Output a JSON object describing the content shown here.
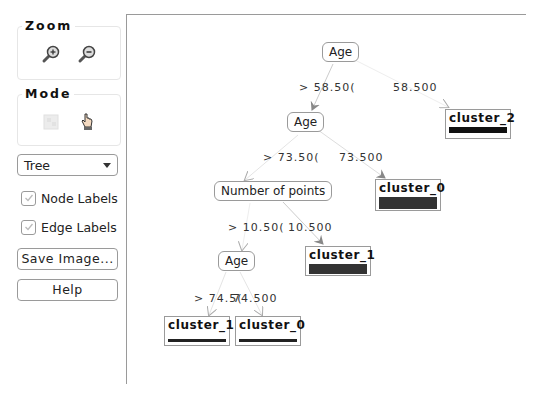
{
  "sidebar": {
    "zoom": {
      "title": "Zoom",
      "icons": [
        "zoom-in-icon",
        "zoom-out-icon"
      ]
    },
    "mode": {
      "title": "Mode",
      "icons": [
        "select-icon",
        "pan-hand-icon"
      ]
    },
    "layout_select": {
      "value": "Tree"
    },
    "node_labels": {
      "label": "Node Labels",
      "checked": true
    },
    "edge_labels": {
      "label": "Edge Labels",
      "checked": true
    },
    "save_image_label": "Save Image...",
    "help_label": "Help"
  },
  "tree": {
    "nodes": [
      {
        "id": "n0",
        "type": "split",
        "label": "Age"
      },
      {
        "id": "n1",
        "type": "split",
        "label": "Age"
      },
      {
        "id": "n2",
        "type": "leaf",
        "label": "cluster_2"
      },
      {
        "id": "n3",
        "type": "split",
        "label": "Number of points"
      },
      {
        "id": "n4",
        "type": "leaf",
        "label": "cluster_0"
      },
      {
        "id": "n5",
        "type": "split",
        "label": "Age"
      },
      {
        "id": "n6",
        "type": "leaf",
        "label": "cluster_1"
      },
      {
        "id": "n7",
        "type": "leaf",
        "label": "cluster_1"
      },
      {
        "id": "n8",
        "type": "leaf",
        "label": "cluster_0"
      }
    ],
    "edges": [
      {
        "from": "n0",
        "to": "n1",
        "label": "> 58.50("
      },
      {
        "from": "n0",
        "to": "n2",
        "label": "58.500"
      },
      {
        "from": "n1",
        "to": "n3",
        "label": "> 73.50("
      },
      {
        "from": "n1",
        "to": "n4",
        "label": "73.500"
      },
      {
        "from": "n3",
        "to": "n5",
        "label": "> 10.50("
      },
      {
        "from": "n3",
        "to": "n6",
        "label": "10.500"
      },
      {
        "from": "n5",
        "to": "n7",
        "label": "> 74.5("
      },
      {
        "from": "n5",
        "to": "n8",
        "label": "74.500"
      }
    ]
  }
}
